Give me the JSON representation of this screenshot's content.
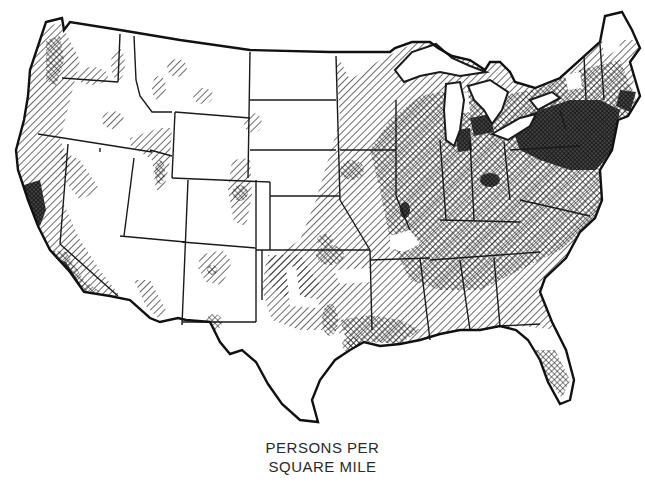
{
  "map": {
    "subject": "Population density of the contiguous United States",
    "caption": {
      "line1": "PERSONS PER",
      "line2": "SQUARE MILE"
    },
    "legend_categories": [
      {
        "name": "sparse",
        "pattern": "blank",
        "color": "#ffffff"
      },
      {
        "name": "low",
        "pattern": "diagonal-hatch",
        "color": "#1a1a1a"
      },
      {
        "name": "medium",
        "pattern": "cross-hatch",
        "color": "#1a1a1a"
      },
      {
        "name": "high",
        "pattern": "solid-stipple",
        "color": "#111111"
      }
    ],
    "colors": {
      "background": "#ffffff",
      "ink": "#1a1a1a",
      "caption_text": "#2a2a2a"
    }
  }
}
